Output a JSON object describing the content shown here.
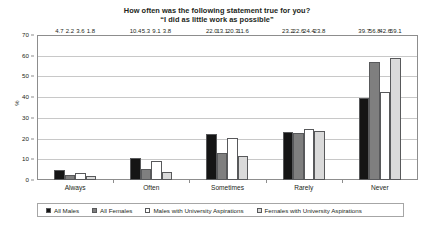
{
  "chart_data": {
    "type": "bar",
    "title_line1": "How often was the following statement true for you?",
    "title_line2": "“I did as little work as possible”",
    "xlabel": "",
    "ylabel": "%",
    "ylim": [
      0,
      70
    ],
    "ytick_step": 10,
    "yticks": [
      "0",
      "10",
      "20",
      "30",
      "40",
      "50",
      "60",
      "70"
    ],
    "grid": true,
    "legend_position": "bottom",
    "categories": [
      "Always",
      "Often",
      "Sometimes",
      "Rarely",
      "Never"
    ],
    "series": [
      {
        "name": "All Males",
        "color": "#151515",
        "values": [
          4.7,
          10.4,
          22.0,
          23.2,
          39.7
        ],
        "labels": [
          "4.7",
          "10.4",
          "22.0",
          "23.2",
          "39.7"
        ]
      },
      {
        "name": "All Females",
        "color": "#7f7f7f",
        "values": [
          2.2,
          5.3,
          13.1,
          22.6,
          56.8
        ],
        "labels": [
          "2.2",
          "5.3",
          "13.1",
          "22.6",
          "56.8"
        ]
      },
      {
        "name": "Males with University Aspirations",
        "color": "#ffffff",
        "values": [
          3.6,
          9.1,
          20.3,
          24.4,
          42.6
        ],
        "labels": [
          "3.6",
          "9.1",
          "20.3",
          "24.4",
          "42.6"
        ]
      },
      {
        "name": "Females with University Aspirations",
        "color": "#dadada",
        "values": [
          1.8,
          3.8,
          11.6,
          23.8,
          59.1
        ],
        "labels": [
          "1.8",
          "3.8",
          "11.6",
          "23.8",
          "59.1"
        ]
      }
    ]
  }
}
